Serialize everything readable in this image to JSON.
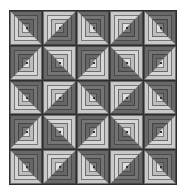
{
  "quilt": {
    "rows": 5,
    "cols": 5,
    "pattern": [
      [
        "A",
        "B",
        "A",
        "B",
        "A"
      ],
      [
        "C",
        "D",
        "C",
        "D",
        "C"
      ],
      [
        "A",
        "B",
        "A",
        "B",
        "A"
      ],
      [
        "C",
        "D",
        "C",
        "D",
        "C"
      ],
      [
        "A",
        "B",
        "A",
        "B",
        "A"
      ]
    ],
    "colors": {
      "dark": "#686868",
      "light": "#c9c9c9",
      "grid_line": "#2e2e2e",
      "center": "#6f6f6f",
      "background": "#ffffff"
    }
  }
}
